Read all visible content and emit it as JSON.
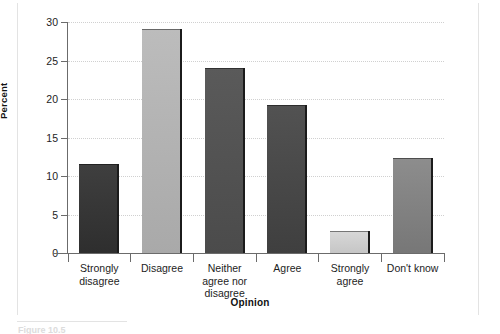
{
  "figure": {
    "caption": "Figure 10.5"
  },
  "chart_data": {
    "type": "bar",
    "title": "",
    "xlabel": "Opinion",
    "ylabel": "Percent",
    "categories": [
      "Strongly disagree",
      "Disagree",
      "Neither agree nor disagree",
      "Agree",
      "Strongly agree",
      "Don't know"
    ],
    "category_lines": [
      [
        "Strongly",
        "disagree"
      ],
      [
        "Disagree"
      ],
      [
        "Neither",
        "agree nor",
        "disagree"
      ],
      [
        "Agree"
      ],
      [
        "Strongly",
        "agree"
      ],
      [
        "Don't know"
      ]
    ],
    "values": [
      11.6,
      29.1,
      24.0,
      19.2,
      2.9,
      12.4
    ],
    "bar_colors": [
      "#3f3f3f",
      "#bcbcbc",
      "#5a5a5a",
      "#525252",
      "#d8d8d8",
      "#8d8d8d"
    ],
    "bar_colors_bottom": [
      "#2e2e2e",
      "#a9a9a9",
      "#4b4b4b",
      "#3f3f3f",
      "#c6c6c6",
      "#777777"
    ],
    "ylim": [
      0,
      30
    ],
    "yticks": [
      0,
      5,
      10,
      15,
      20,
      25,
      30
    ],
    "ytick_labels": [
      "0",
      "5",
      "10",
      "15",
      "20",
      "25",
      "30"
    ],
    "grid": true,
    "grid_axis": "y",
    "legend": "none",
    "axis_color": "#6b6b6b",
    "grid_color": "#d0d0d0",
    "background": "#ffffff"
  }
}
